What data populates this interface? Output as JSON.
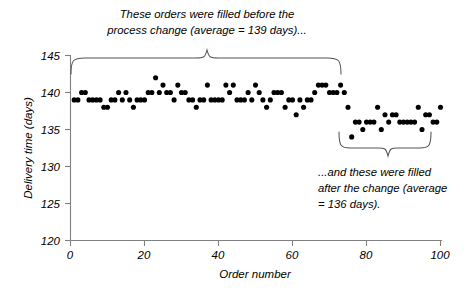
{
  "chart_data": {
    "type": "scatter",
    "title": "",
    "xlabel": "Order number",
    "ylabel": "Delivery time (days)",
    "xlim": [
      0,
      100
    ],
    "ylim": [
      120,
      145
    ],
    "xticks": [
      0,
      20,
      40,
      60,
      80,
      100
    ],
    "yticks": [
      120,
      125,
      130,
      135,
      140,
      145
    ],
    "grid": false,
    "legend": "none",
    "marker": "filled-circle",
    "marker_color": "#000000",
    "series": [
      {
        "name": "Delivery time",
        "x": [
          1,
          2,
          3,
          4,
          5,
          6,
          7,
          8,
          9,
          10,
          11,
          12,
          13,
          14,
          15,
          16,
          17,
          18,
          19,
          20,
          21,
          22,
          23,
          24,
          25,
          26,
          27,
          28,
          29,
          30,
          31,
          32,
          33,
          34,
          35,
          36,
          37,
          38,
          39,
          40,
          41,
          42,
          43,
          44,
          45,
          46,
          47,
          48,
          49,
          50,
          51,
          52,
          53,
          54,
          55,
          56,
          57,
          58,
          59,
          60,
          61,
          62,
          63,
          64,
          65,
          66,
          67,
          68,
          69,
          70,
          71,
          72,
          73,
          74,
          75,
          76,
          77,
          78,
          79,
          80,
          81,
          82,
          83,
          84,
          85,
          86,
          87,
          88,
          89,
          90,
          91,
          92,
          93,
          94,
          95,
          96,
          97,
          98,
          99,
          100
        ],
        "values": [
          139,
          139,
          140,
          140,
          139,
          139,
          139,
          139,
          138,
          138,
          139,
          139,
          140,
          139,
          140,
          139,
          138,
          139,
          139,
          139,
          140,
          140,
          142,
          140,
          141,
          140,
          140,
          139,
          141,
          140,
          140,
          139,
          139,
          138,
          139,
          139,
          141,
          139,
          139,
          139,
          139,
          141,
          140,
          141,
          139,
          139,
          139,
          140,
          139,
          141,
          140,
          139,
          138,
          139,
          140,
          140,
          140,
          138,
          139,
          139,
          137,
          139,
          138,
          139,
          139,
          140,
          141,
          141,
          141,
          140,
          140,
          140,
          141,
          140,
          138,
          134,
          136,
          136,
          135,
          136,
          136,
          136,
          138,
          135,
          137,
          136,
          137,
          137,
          136,
          136,
          136,
          136,
          136,
          138,
          135,
          137,
          137,
          136,
          136,
          138
        ]
      }
    ],
    "annotations": [
      {
        "name": "before-change-note",
        "lines": [
          "These orders were filled before the",
          "process change (average = 139 days)..."
        ],
        "span_x": [
          1,
          75
        ],
        "average": 139
      },
      {
        "name": "after-change-note",
        "lines": [
          "...and these were filled",
          "after the change (average",
          "= 136 days)."
        ],
        "span_x": [
          76,
          100
        ],
        "average": 136
      }
    ]
  }
}
